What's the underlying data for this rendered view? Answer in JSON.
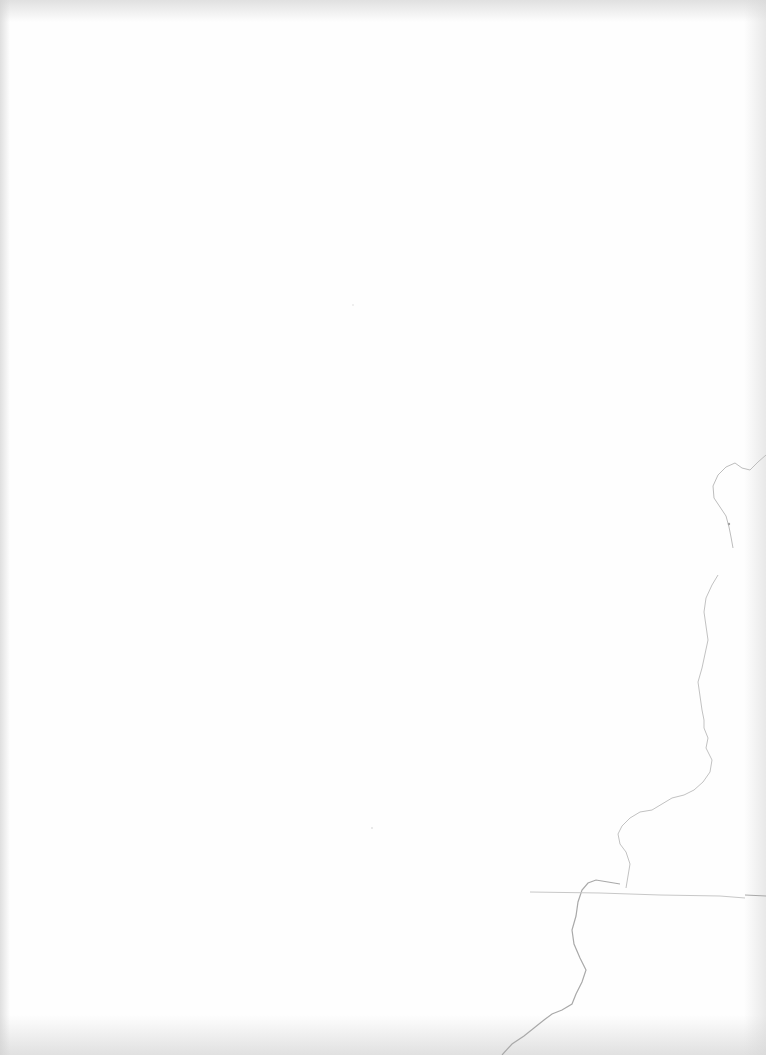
{
  "page": {
    "type": "blank-scanned-sheet",
    "text_content": "",
    "background_color": "#fefefe",
    "artifact_color": "#b5b5b5"
  }
}
